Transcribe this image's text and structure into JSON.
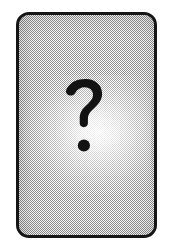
{
  "image": {
    "kind": "placeholder-card",
    "width": 171,
    "height": 248,
    "background_color": "#ffffff",
    "alt_text": "Unknown card placeholder with question mark"
  },
  "card": {
    "label": "",
    "border_color": "#151515",
    "fill_color": "#bcbcbc",
    "texture": "halftone-dither",
    "corner_radius_px": 13,
    "border_width_px": 3,
    "x": 16,
    "y": 12,
    "width": 141,
    "height": 226
  },
  "glyph": {
    "character": "?",
    "name": "question-mark",
    "color": "#121212",
    "center_x": 86,
    "center_y": 118
  },
  "glow": {
    "name": "radial-highlight",
    "color": "#ffffff"
  }
}
